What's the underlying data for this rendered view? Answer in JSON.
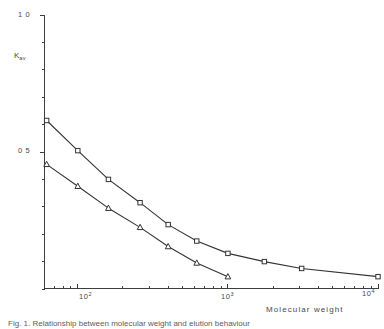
{
  "figure": {
    "caption": "Fig. 1. Relationship between molecular weight and elution behaviour",
    "background_color": "#ffffff",
    "ink_color": "#333333"
  },
  "axes": {
    "y": {
      "title_main": "K",
      "title_sub": "av",
      "labels": [
        {
          "text": "1 0",
          "value": 1.0
        },
        {
          "text": "0 5",
          "value": 0.5
        }
      ],
      "range": [
        0,
        1.0
      ],
      "scale": "linear",
      "minor_tick_step": 0.1
    },
    "x": {
      "title": "Molecular weight",
      "labels": [
        {
          "mantissa": "10",
          "exponent": "2",
          "value": 100
        },
        {
          "mantissa": "10",
          "exponent": "3",
          "value": 1000
        },
        {
          "mantissa": "10",
          "exponent": "4",
          "value": 10000
        }
      ],
      "range": [
        60,
        10000
      ],
      "scale": "log"
    }
  },
  "chart_data": {
    "type": "line",
    "title": "",
    "xlabel": "Molecular weight",
    "ylabel": "Kav",
    "xscale": "log",
    "yscale": "linear",
    "xlim": [
      60,
      10000
    ],
    "ylim": [
      0,
      1.0
    ],
    "grid": false,
    "legend": "none",
    "series": [
      {
        "name": "upper-curve",
        "marker": "open-square",
        "x": [
          62,
          100,
          160,
          260,
          400,
          620,
          1000,
          1750,
          3100,
          10000
        ],
        "y": [
          0.615,
          0.505,
          0.4,
          0.315,
          0.235,
          0.175,
          0.13,
          0.1,
          0.075,
          0.045
        ]
      },
      {
        "name": "lower-curve",
        "marker": "open-triangle",
        "x": [
          62,
          100,
          160,
          260,
          400,
          620,
          1000
        ],
        "y": [
          0.455,
          0.375,
          0.295,
          0.225,
          0.155,
          0.095,
          0.045
        ]
      }
    ]
  }
}
